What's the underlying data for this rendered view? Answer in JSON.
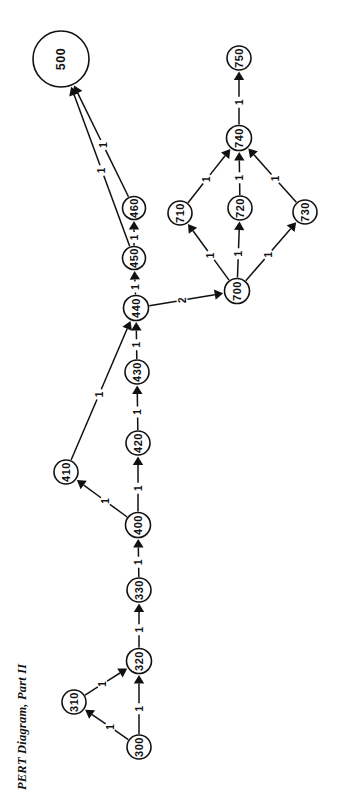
{
  "title": {
    "text": "PERT Diagram, Part II",
    "x": 22,
    "y": 790,
    "rotation": -90
  },
  "canvas": {
    "width": 346,
    "height": 803,
    "background": "#ffffff"
  },
  "style": {
    "node_stroke": "#111111",
    "node_fill": "#ffffff",
    "edge_stroke": "#111111",
    "text_color": "#111111"
  },
  "chart_data": {
    "type": "diagram",
    "subtype": "pert-network",
    "title": "PERT Diagram, Part II",
    "orientation": "rotated-90",
    "node_count": 16,
    "edge_count": 17,
    "nodes": [
      {
        "id": "300",
        "label": "300",
        "cx": 139,
        "cy": 747,
        "r": 12
      },
      {
        "id": "310",
        "label": "310",
        "cx": 74,
        "cy": 702,
        "r": 12
      },
      {
        "id": "320",
        "label": "320",
        "cx": 139,
        "cy": 661,
        "r": 12.5
      },
      {
        "id": "330",
        "label": "330",
        "cx": 139,
        "cy": 590,
        "r": 12
      },
      {
        "id": "400",
        "label": "400",
        "cx": 138,
        "cy": 525,
        "r": 12.5
      },
      {
        "id": "410",
        "label": "410",
        "cx": 66,
        "cy": 472,
        "r": 12
      },
      {
        "id": "420",
        "label": "420",
        "cx": 138,
        "cy": 443,
        "r": 12
      },
      {
        "id": "430",
        "label": "430",
        "cx": 137,
        "cy": 372,
        "r": 12
      },
      {
        "id": "440",
        "label": "440",
        "cx": 136,
        "cy": 308,
        "r": 12.5
      },
      {
        "id": "450",
        "label": "450",
        "cx": 134,
        "cy": 258,
        "r": 11.5
      },
      {
        "id": "460",
        "label": "460",
        "cx": 134,
        "cy": 208,
        "r": 11.5
      },
      {
        "id": "500",
        "label": "500",
        "cx": 61,
        "cy": 59,
        "r": 28
      },
      {
        "id": "700",
        "label": "700",
        "cx": 237,
        "cy": 291,
        "r": 12.5
      },
      {
        "id": "710",
        "label": "710",
        "cx": 180,
        "cy": 213,
        "r": 12
      },
      {
        "id": "720",
        "label": "720",
        "cx": 240,
        "cy": 208,
        "r": 12
      },
      {
        "id": "730",
        "label": "730",
        "cx": 305,
        "cy": 212,
        "r": 12
      },
      {
        "id": "740",
        "label": "740",
        "cx": 239,
        "cy": 138,
        "r": 12.5
      },
      {
        "id": "750",
        "label": "750",
        "cx": 239,
        "cy": 58,
        "r": 12
      }
    ],
    "edges": [
      {
        "from": "300",
        "to": "310",
        "label": "1"
      },
      {
        "from": "300",
        "to": "320",
        "label": "1"
      },
      {
        "from": "310",
        "to": "320",
        "label": "1"
      },
      {
        "from": "320",
        "to": "330",
        "label": "1"
      },
      {
        "from": "330",
        "to": "400",
        "label": "1"
      },
      {
        "from": "400",
        "to": "410",
        "label": "1"
      },
      {
        "from": "400",
        "to": "420",
        "label": "1"
      },
      {
        "from": "410",
        "to": "440",
        "label": "1"
      },
      {
        "from": "420",
        "to": "430",
        "label": "1"
      },
      {
        "from": "430",
        "to": "440",
        "label": "1"
      },
      {
        "from": "440",
        "to": "450",
        "label": "1"
      },
      {
        "from": "440",
        "to": "700",
        "label": "2"
      },
      {
        "from": "450",
        "to": "460",
        "label": "1"
      },
      {
        "from": "450",
        "to": "500",
        "label": "1"
      },
      {
        "from": "460",
        "to": "500",
        "label": "1"
      },
      {
        "from": "700",
        "to": "710",
        "label": "1"
      },
      {
        "from": "700",
        "to": "720",
        "label": "1"
      },
      {
        "from": "700",
        "to": "730",
        "label": "1"
      },
      {
        "from": "710",
        "to": "740",
        "label": "1"
      },
      {
        "from": "720",
        "to": "740",
        "label": "1"
      },
      {
        "from": "730",
        "to": "740",
        "label": "1"
      },
      {
        "from": "740",
        "to": "750",
        "label": "1"
      }
    ]
  }
}
